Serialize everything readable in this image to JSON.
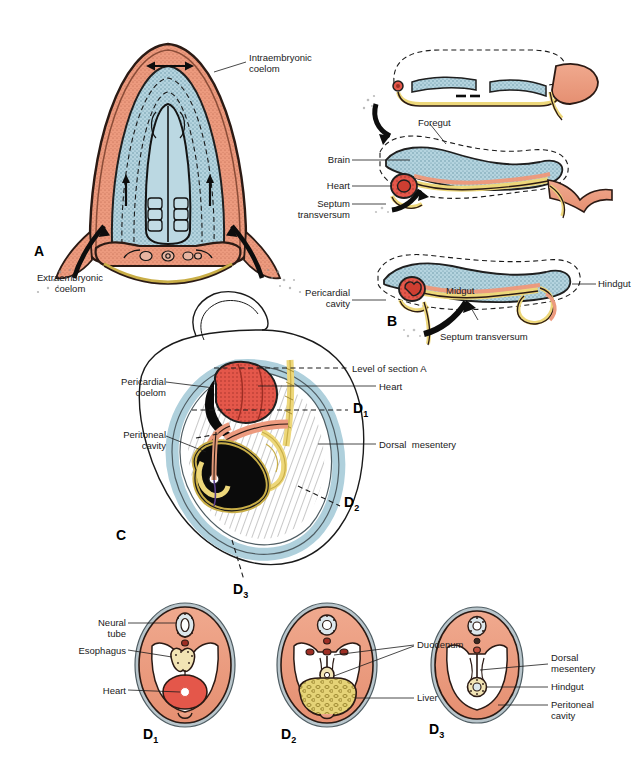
{
  "figure": {
    "domain": "embryology-diagram",
    "title_visible": false,
    "background": "#ffffff",
    "palette": {
      "mesoderm_salmon": "#EC9A7E",
      "mesoderm_salmon_dark": "#D9765A",
      "coelom_blue": "#AFD0DC",
      "coelom_blue_dark": "#7FAEC0",
      "gut_yellow": "#EDD77A",
      "gut_yellow_dark": "#C9AE47",
      "heart_red": "#E4574A",
      "heart_red_dark": "#B8382C",
      "liver_black": "#0B0B0B",
      "outline": "#1a1a1a",
      "body_wall_gray": "#9FB0B8",
      "amnion_gray": "#B9C6CC",
      "text": "#1a1a1a"
    }
  },
  "panels": [
    {
      "id": "A",
      "letter": "A",
      "letter_sub": "",
      "description": "transverse section of early embryo showing intraembryonic coelom horseshoe"
    },
    {
      "id": "top-right",
      "letter": "",
      "letter_sub": "",
      "description": "flat embryo sagittal section before folding"
    },
    {
      "id": "mid-right",
      "letter": "",
      "letter_sub": "",
      "description": "sagittal section during head fold, foregut forming"
    },
    {
      "id": "B",
      "letter": "B",
      "letter_sub": "",
      "description": "sagittal section after folding, foregut midgut hindgut"
    },
    {
      "id": "C",
      "letter": "C",
      "letter_sub": "",
      "description": "sagittal view of folded embryo with section levels"
    },
    {
      "id": "D1",
      "letter": "D",
      "letter_sub": "1",
      "description": "transverse section at thoracic level"
    },
    {
      "id": "D2",
      "letter": "D",
      "letter_sub": "2",
      "description": "transverse section at hepatic level"
    },
    {
      "id": "D3",
      "letter": "D",
      "letter_sub": "3",
      "description": "transverse section at caudal level"
    }
  ],
  "labels": {
    "panel_a": {
      "intraembryonic_coelom": "Intraembryonic\ncoelom",
      "extraembryonic_coelom": "Extraembryonic\ncoelom"
    },
    "panel_mid_right": {
      "foregut": "Foregut",
      "brain": "Brain",
      "heart": "Heart",
      "septum_transversum": "Septum\ntransversum"
    },
    "panel_b": {
      "pericardial_cavity": "Pericardial\ncavity",
      "midgut": "Midgut",
      "hindgut": "Hindgut",
      "septum_transversum": "Septum transversum"
    },
    "panel_c": {
      "pericardial_coelom": "Pericardial\ncoelom",
      "peritoneal_cavity": "Peritoneal\ncavity",
      "level_of_section_a": "Level of section A",
      "heart": "Heart",
      "dorsal_mesentery": "Dorsal  mesentery"
    },
    "panel_d1": {
      "neural_tube": "Neural\ntube",
      "esophagus": "Esophagus",
      "heart": "Heart"
    },
    "panel_d2": {
      "duodenum": "Duodenum",
      "liver": "Liver"
    },
    "panel_d3": {
      "dorsal_mesentery": "Dorsal\nmesentery",
      "hindgut": "Hindgut",
      "peritoneal_cavity": "Peritoneal\ncavity"
    }
  },
  "panel_letters": {
    "a": "A",
    "b": "B",
    "c": "C",
    "d": "D",
    "sub1": "1",
    "sub2": "2",
    "sub3": "3"
  }
}
